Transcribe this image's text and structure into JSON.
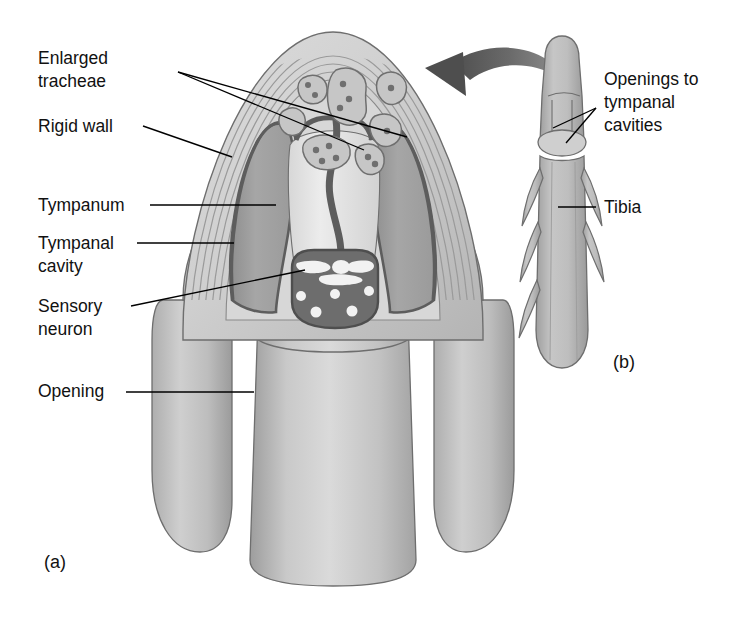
{
  "figure": {
    "title_visible": false,
    "background_color": "#ffffff",
    "panels": [
      {
        "id": "a",
        "label": "(a)",
        "x": 44,
        "y": 568,
        "description": "cross-section of insect tibia showing tympanal organ"
      },
      {
        "id": "b",
        "label": "(b)",
        "x": 613,
        "y": 368,
        "description": "external view of tibia with openings to tympanal cavities"
      }
    ],
    "labels": [
      {
        "name": "enlarged-tracheae",
        "lines": [
          "Enlarged",
          "tracheae"
        ],
        "x": 38,
        "y": 64,
        "line_height": 23,
        "leaders": [
          {
            "points": "178,72 364,150"
          },
          {
            "points": "178,72 407,137"
          }
        ]
      },
      {
        "name": "rigid-wall",
        "lines": [
          "Rigid wall"
        ],
        "x": 38,
        "y": 132,
        "line_height": 23,
        "leaders": [
          {
            "points": "143,126 232,157"
          }
        ]
      },
      {
        "name": "tympanum",
        "lines": [
          "Tympanum"
        ],
        "x": 38,
        "y": 211,
        "line_height": 23,
        "leaders": [
          {
            "points": "150,205 276,205"
          }
        ]
      },
      {
        "name": "tympanal-cavity",
        "lines": [
          "Tympanal",
          "cavity"
        ],
        "x": 38,
        "y": 249,
        "line_height": 23,
        "leaders": [
          {
            "points": "137,243 234,243"
          }
        ]
      },
      {
        "name": "sensory-neuron",
        "lines": [
          "Sensory",
          "neuron"
        ],
        "x": 38,
        "y": 312,
        "line_height": 23,
        "leaders": [
          {
            "points": "131,306 305,270"
          }
        ]
      },
      {
        "name": "opening",
        "lines": [
          "Opening"
        ],
        "x": 38,
        "y": 397,
        "line_height": 23,
        "leaders": [
          {
            "points": "126,392 254,392"
          }
        ]
      },
      {
        "name": "openings-to-tympanal-cavities",
        "lines": [
          "Openings to",
          "tympanal",
          "cavities"
        ],
        "x": 604,
        "y": 85,
        "line_height": 23,
        "leaders": [
          {
            "points": "596,108 553,128"
          },
          {
            "points": "596,108 566,143"
          }
        ]
      },
      {
        "name": "tibia",
        "lines": [
          "Tibia"
        ],
        "x": 604,
        "y": 213,
        "line_height": 23,
        "leaders": [
          {
            "points": "596,207 558,207"
          }
        ]
      }
    ],
    "arrow": {
      "name": "magnification-arrow",
      "description": "curved arrow pointing from tibia (b) to cross-section (a)"
    },
    "colors": {
      "outline": "#6b6b6b",
      "outline_dark": "#4a4a4a",
      "cuticle_light": "#d0d0d0",
      "cuticle_mid": "#bdbdbd",
      "tympanum_light": "#e2e2e2",
      "tympanal_cavity": "#a2a2a2",
      "tympanal_cavity_dark": "#8f8f8f",
      "neuron_mass": "#6d6d6d",
      "neuron_cell": "#f2f2f2",
      "trachea_fill": "#c4c4c4",
      "trachea_dot": "#6f6f6f",
      "arrow_fill": "#5c5c5c",
      "leg_fill": "#b9b9b9",
      "leg_shadow": "#9e9e9e",
      "text": "#111111"
    }
  }
}
